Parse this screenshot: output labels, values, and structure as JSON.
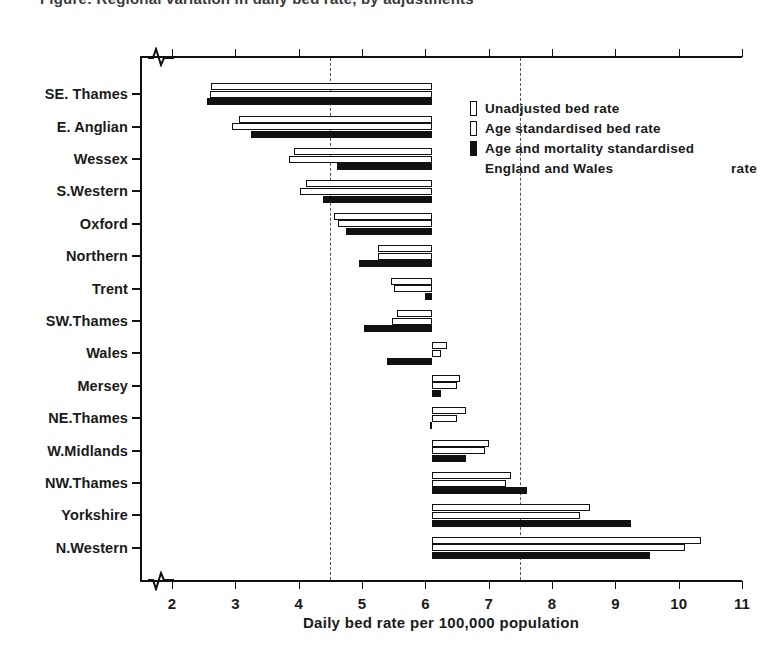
{
  "chart_data": {
    "type": "bar",
    "orientation": "horizontal",
    "title": "Figure: Regional variation in daily bed rate, by adjustments",
    "xlabel": "Daily bed rate per 100,000 population",
    "ylabel": "",
    "xlim": [
      2,
      11
    ],
    "xticks": [
      2,
      3,
      4,
      5,
      6,
      7,
      8,
      9,
      10,
      11
    ],
    "xtick_labels": [
      "2",
      "3",
      "4",
      "5",
      "6",
      "7",
      "8",
      "9",
      "10",
      "11"
    ],
    "grid": false,
    "axis_break": true,
    "baseline": 6.1,
    "reference_lines": [
      4.5,
      7.5
    ],
    "legend_position": "upper right",
    "categories": [
      "SE. Thames",
      "E. Anglian",
      "Wessex",
      "S.Western",
      "Oxford",
      "Northern",
      "Trent",
      "SW.Thames",
      "Wales",
      "Mersey",
      "NE.Thames",
      "W.Midlands",
      "NW.Thames",
      "Yorkshire",
      "N.Western"
    ],
    "series": [
      {
        "name": "Unadjusted bed rate",
        "style": "open",
        "values": [
          2.62,
          3.05,
          3.92,
          4.12,
          4.55,
          5.25,
          5.45,
          5.55,
          6.35,
          6.55,
          6.65,
          7.0,
          7.35,
          8.6,
          10.35
        ]
      },
      {
        "name": "Age standardised bed rate",
        "style": "open",
        "values": [
          2.6,
          2.95,
          3.85,
          4.02,
          4.62,
          5.25,
          5.5,
          5.48,
          6.25,
          6.5,
          6.5,
          6.95,
          7.28,
          8.45,
          10.1
        ]
      },
      {
        "name": "Age and mortality standardised rate",
        "style": "solid",
        "values": [
          2.55,
          3.25,
          4.6,
          4.38,
          4.75,
          4.95,
          6.0,
          5.03,
          5.4,
          6.25,
          6.08,
          6.65,
          7.6,
          9.25,
          9.55
        ]
      }
    ],
    "legend_note": "England and Wales"
  },
  "legend": {
    "items": [
      {
        "label": "Unadjusted bed rate",
        "style": "open"
      },
      {
        "label": "Age standardised bed rate",
        "style": "open"
      },
      {
        "label": "Age and mortality standardised",
        "style": "solid"
      }
    ],
    "sub_left": "England and Wales",
    "sub_right": "rate"
  }
}
